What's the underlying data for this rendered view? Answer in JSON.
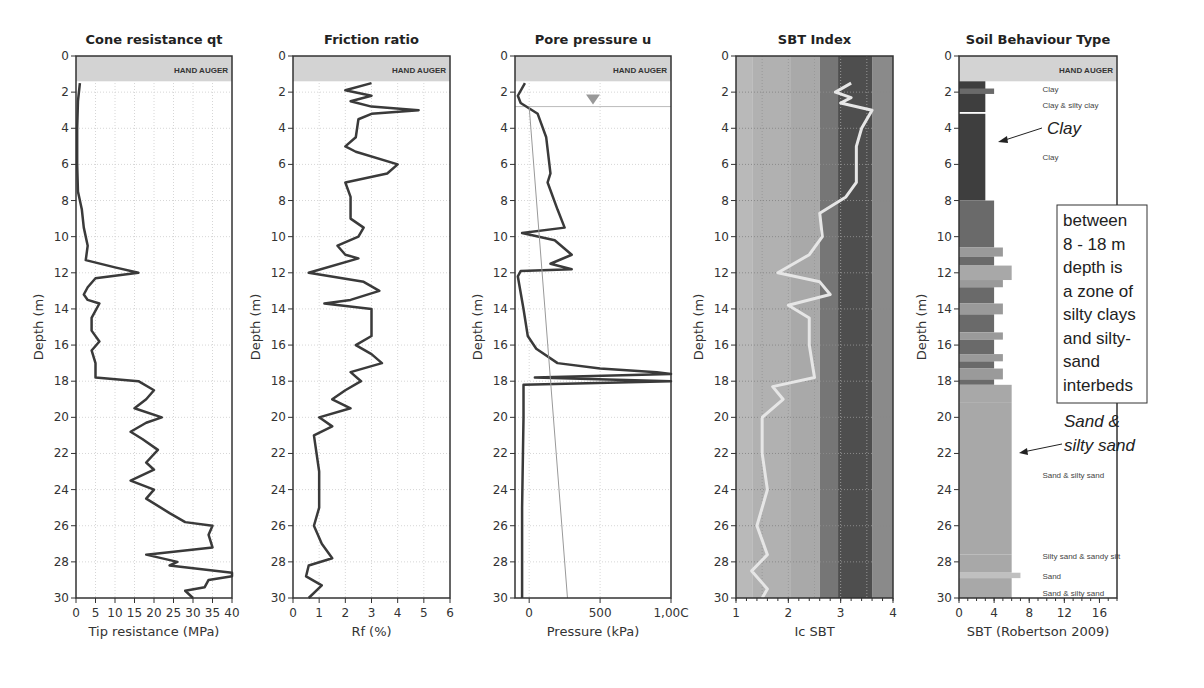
{
  "depth_axis": {
    "label": "Depth (m)",
    "min": 0,
    "max": 30,
    "ticks": [
      0,
      2,
      4,
      6,
      8,
      10,
      12,
      14,
      16,
      18,
      20,
      22,
      24,
      26,
      28,
      30
    ]
  },
  "hand_auger": {
    "label": "HAND AUGER",
    "depth_to": 1.4
  },
  "panels": [
    {
      "title": "Cone resistance qt",
      "xlabel": "Tip resistance (MPa)",
      "ticks": [
        "0",
        "5",
        "10",
        "15",
        "20",
        "25",
        "30",
        "35",
        "40"
      ]
    },
    {
      "title": "Friction ratio",
      "xlabel": "Rf (%)",
      "ticks": [
        "0",
        "1",
        "2",
        "3",
        "4",
        "5",
        "6"
      ]
    },
    {
      "title": "Pore pressure u",
      "xlabel": "Pressure (kPa)",
      "ticks": [
        "0",
        "500",
        "1,00C"
      ]
    },
    {
      "title": "SBT Index",
      "xlabel": "Ic SBT",
      "ticks": [
        "1",
        "2",
        "3",
        "4"
      ]
    },
    {
      "title": "Soil Behaviour Type",
      "xlabel": "SBT (Robertson 2009)",
      "ticks": [
        "0",
        "4",
        "8",
        "12",
        "16"
      ]
    }
  ],
  "sbt_labels": [
    {
      "depth": 1.8,
      "text": "Clay"
    },
    {
      "depth": 2.7,
      "text": "Clay & silty clay"
    },
    {
      "depth": 5.6,
      "text": "Clay"
    },
    {
      "depth": 23.2,
      "text": "Sand & silty sand"
    },
    {
      "depth": 27.7,
      "text": "Silty sand & sandy silt"
    },
    {
      "depth": 28.8,
      "text": "Sand"
    },
    {
      "depth": 29.7,
      "text": "Sand & silty sand"
    }
  ],
  "annotations": {
    "clay": "Clay",
    "box_lines": [
      "between",
      "8 - 18 m",
      "depth is",
      "a zone of",
      "silty clays",
      "and silty-",
      "sand",
      "interbeds"
    ],
    "sand_line1": "Sand &",
    "sand_line2": "silty sand"
  },
  "chart_data": [
    {
      "type": "line",
      "title": "Cone resistance qt",
      "xlabel": "Tip resistance (MPa)",
      "ylabel": "Depth (m)",
      "xlim": [
        0,
        40
      ],
      "ylim": [
        30,
        0
      ],
      "series": [
        {
          "name": "qt",
          "points": [
            [
              1,
              1.5
            ],
            [
              0.5,
              2.5
            ],
            [
              0.3,
              4
            ],
            [
              0.3,
              6
            ],
            [
              0.5,
              7.5
            ],
            [
              1.5,
              8.5
            ],
            [
              2,
              9.5
            ],
            [
              3,
              10.5
            ],
            [
              2.5,
              11.3
            ],
            [
              10,
              11.7
            ],
            [
              16,
              12
            ],
            [
              5,
              12.3
            ],
            [
              3,
              12.8
            ],
            [
              2,
              13.2
            ],
            [
              3,
              13.5
            ],
            [
              6,
              13.7
            ],
            [
              4,
              14.5
            ],
            [
              4,
              15.2
            ],
            [
              6,
              15.8
            ],
            [
              4,
              16.3
            ],
            [
              5,
              17
            ],
            [
              5,
              17.8
            ],
            [
              16,
              18
            ],
            [
              20,
              18.5
            ],
            [
              18,
              19
            ],
            [
              15,
              19.5
            ],
            [
              22,
              20
            ],
            [
              18,
              20.3
            ],
            [
              14,
              20.8
            ],
            [
              17,
              21.2
            ],
            [
              21,
              21.8
            ],
            [
              18,
              22.5
            ],
            [
              20,
              22.9
            ],
            [
              14,
              23.5
            ],
            [
              20,
              24
            ],
            [
              18,
              24.5
            ],
            [
              24,
              25.3
            ],
            [
              28,
              25.8
            ],
            [
              35,
              26
            ],
            [
              34,
              26.5
            ],
            [
              35,
              27.2
            ],
            [
              18,
              27.6
            ],
            [
              26,
              28
            ],
            [
              24,
              28.2
            ],
            [
              40,
              28.6
            ],
            [
              40,
              28.8
            ],
            [
              34,
              29
            ],
            [
              33,
              29.4
            ],
            [
              28,
              29.6
            ],
            [
              30,
              30
            ]
          ]
        }
      ]
    },
    {
      "type": "line",
      "title": "Friction ratio",
      "xlabel": "Rf (%)",
      "ylabel": "Depth (m)",
      "xlim": [
        0,
        6
      ],
      "ylim": [
        30,
        0
      ],
      "series": [
        {
          "name": "Rf",
          "points": [
            [
              3,
              1.5
            ],
            [
              2,
              1.9
            ],
            [
              3,
              2.2
            ],
            [
              2.2,
              2.5
            ],
            [
              3,
              2.8
            ],
            [
              4.8,
              3
            ],
            [
              3,
              3.2
            ],
            [
              2.5,
              3.5
            ],
            [
              2.4,
              4.5
            ],
            [
              2,
              5
            ],
            [
              2.4,
              5.3
            ],
            [
              4,
              6
            ],
            [
              3.6,
              6.5
            ],
            [
              2,
              7
            ],
            [
              2.2,
              7.8
            ],
            [
              2.2,
              9
            ],
            [
              2.7,
              9.5
            ],
            [
              2.5,
              10
            ],
            [
              1.7,
              10.5
            ],
            [
              2,
              11
            ],
            [
              2.5,
              11.2
            ],
            [
              0.6,
              12
            ],
            [
              2.7,
              12.5
            ],
            [
              3.3,
              13
            ],
            [
              2.2,
              13.5
            ],
            [
              1.2,
              13.7
            ],
            [
              3,
              14
            ],
            [
              3,
              15
            ],
            [
              3,
              15.5
            ],
            [
              2.4,
              16
            ],
            [
              3,
              16.5
            ],
            [
              3.4,
              17
            ],
            [
              2.2,
              17.5
            ],
            [
              2.6,
              18
            ],
            [
              2,
              18.5
            ],
            [
              1.5,
              19
            ],
            [
              2.2,
              19.5
            ],
            [
              1,
              20
            ],
            [
              1.5,
              20.5
            ],
            [
              0.8,
              21
            ],
            [
              1,
              23
            ],
            [
              1,
              25
            ],
            [
              0.8,
              26
            ],
            [
              1.1,
              27
            ],
            [
              1.5,
              27.8
            ],
            [
              0.6,
              28.2
            ],
            [
              0.5,
              28.8
            ],
            [
              1.1,
              29.3
            ],
            [
              0.6,
              30
            ]
          ]
        }
      ]
    },
    {
      "type": "line",
      "title": "Pore pressure u",
      "xlabel": "Pressure (kPa)",
      "ylabel": "Depth (m)",
      "xlim": [
        -100,
        1000
      ],
      "ylim": [
        30,
        0
      ],
      "series": [
        {
          "name": "u",
          "points": [
            [
              -30,
              1.5
            ],
            [
              -80,
              2.2
            ],
            [
              -60,
              2.6
            ],
            [
              60,
              3.2
            ],
            [
              120,
              4.5
            ],
            [
              150,
              6.5
            ],
            [
              130,
              7
            ],
            [
              200,
              8.5
            ],
            [
              250,
              9.5
            ],
            [
              -50,
              9.8
            ],
            [
              180,
              10.2
            ],
            [
              300,
              11
            ],
            [
              150,
              11.5
            ],
            [
              300,
              11.8
            ],
            [
              -60,
              11.9
            ],
            [
              -80,
              12.2
            ],
            [
              -40,
              14
            ],
            [
              -10,
              15.5
            ],
            [
              50,
              16.2
            ],
            [
              200,
              17
            ],
            [
              500,
              17.3
            ],
            [
              900,
              17.5
            ],
            [
              1000,
              17.6
            ],
            [
              40,
              17.8
            ],
            [
              1000,
              18
            ],
            [
              -40,
              18.2
            ],
            [
              -40,
              20
            ],
            [
              -50,
              25
            ],
            [
              -50,
              30
            ]
          ]
        },
        {
          "name": "u0 hydrostatic",
          "points": [
            [
              0,
              2.8
            ],
            [
              270,
              30
            ]
          ]
        }
      ],
      "water_table": {
        "depth": 2.8,
        "x": 450
      }
    },
    {
      "type": "line",
      "title": "SBT Index",
      "xlabel": "Ic SBT",
      "ylabel": "Depth (m)",
      "xlim": [
        1,
        4
      ],
      "ylim": [
        30,
        0
      ],
      "zones": [
        [
          1,
          1.31
        ],
        [
          1.31,
          2.05
        ],
        [
          2.05,
          2.6
        ],
        [
          2.6,
          2.95
        ],
        [
          2.95,
          3.6
        ],
        [
          3.6,
          4
        ]
      ],
      "series": [
        {
          "name": "Ic",
          "points": [
            [
              3.2,
              1.5
            ],
            [
              2.9,
              2
            ],
            [
              3.2,
              2.3
            ],
            [
              3.0,
              2.6
            ],
            [
              3.6,
              3
            ],
            [
              3.4,
              4
            ],
            [
              3.3,
              5
            ],
            [
              3.3,
              7
            ],
            [
              3.1,
              7.8
            ],
            [
              2.6,
              8.7
            ],
            [
              2.65,
              10
            ],
            [
              2.4,
              11
            ],
            [
              1.8,
              12
            ],
            [
              2.6,
              12.5
            ],
            [
              2.8,
              13.2
            ],
            [
              2.0,
              13.8
            ],
            [
              2.4,
              14.5
            ],
            [
              2.4,
              16
            ],
            [
              2.5,
              17.8
            ],
            [
              1.7,
              18.3
            ],
            [
              1.9,
              19
            ],
            [
              1.5,
              20
            ],
            [
              1.5,
              22
            ],
            [
              1.6,
              24
            ],
            [
              1.4,
              26
            ],
            [
              1.6,
              27.6
            ],
            [
              1.3,
              28.5
            ],
            [
              1.6,
              29.5
            ],
            [
              1.5,
              30
            ]
          ]
        }
      ]
    },
    {
      "type": "bar",
      "title": "Soil Behaviour Type",
      "xlabel": "SBT (Robertson 2009)",
      "ylabel": "Depth (m)",
      "xlim": [
        0,
        18
      ],
      "ylim": [
        30,
        0
      ],
      "layers": [
        {
          "from": 1.4,
          "to": 3.1,
          "sbt": 3
        },
        {
          "from": 1.8,
          "to": 2.1,
          "sbt": 4
        },
        {
          "from": 3.2,
          "to": 8.0,
          "sbt": 3
        },
        {
          "from": 8.0,
          "to": 10.6,
          "sbt": 4
        },
        {
          "from": 10.6,
          "to": 11.1,
          "sbt": 5
        },
        {
          "from": 11.1,
          "to": 11.6,
          "sbt": 4
        },
        {
          "from": 11.6,
          "to": 12.4,
          "sbt": 6
        },
        {
          "from": 12.4,
          "to": 12.8,
          "sbt": 5
        },
        {
          "from": 12.8,
          "to": 13.7,
          "sbt": 4
        },
        {
          "from": 13.7,
          "to": 14.3,
          "sbt": 5
        },
        {
          "from": 14.3,
          "to": 15.3,
          "sbt": 4
        },
        {
          "from": 15.3,
          "to": 15.7,
          "sbt": 5
        },
        {
          "from": 15.7,
          "to": 16.5,
          "sbt": 4
        },
        {
          "from": 16.5,
          "to": 16.9,
          "sbt": 5
        },
        {
          "from": 16.9,
          "to": 17.3,
          "sbt": 4
        },
        {
          "from": 17.3,
          "to": 17.9,
          "sbt": 5
        },
        {
          "from": 17.9,
          "to": 18.2,
          "sbt": 4
        },
        {
          "from": 18.2,
          "to": 19.2,
          "sbt": 6
        },
        {
          "from": 19.2,
          "to": 27.6,
          "sbt": 6
        },
        {
          "from": 27.6,
          "to": 28.6,
          "sbt": 6
        },
        {
          "from": 28.6,
          "to": 28.9,
          "sbt": 7
        },
        {
          "from": 28.9,
          "to": 30,
          "sbt": 6
        }
      ]
    }
  ]
}
